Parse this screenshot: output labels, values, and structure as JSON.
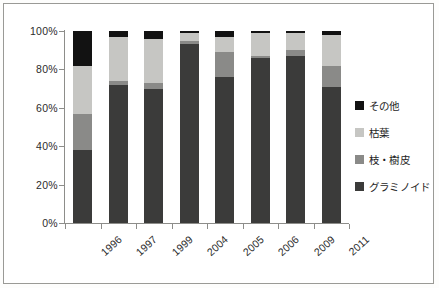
{
  "chart_data": {
    "type": "bar",
    "subtype": "stacked-percent",
    "title": "",
    "xlabel": "",
    "ylabel": "",
    "categories": [
      "1996",
      "1997",
      "1999",
      "2004",
      "2005",
      "2006",
      "2009",
      "2011"
    ],
    "ylim": [
      0,
      100
    ],
    "ytick_labels": [
      "0%",
      "20%",
      "40%",
      "60%",
      "80%",
      "100%"
    ],
    "ytick_values": [
      0,
      20,
      40,
      60,
      80,
      100
    ],
    "grid": false,
    "legend_position": "right",
    "stack_order_bottom_to_top": [
      "グラミノイド",
      "枝・樹皮",
      "枯葉",
      "その他"
    ],
    "series": [
      {
        "name": "グラミノイド",
        "color": "#3b3b3a",
        "values": [
          38,
          72,
          70,
          93,
          76,
          86,
          87,
          71
        ]
      },
      {
        "name": "枝・樹皮",
        "color": "#8a8a88",
        "values": [
          19,
          2,
          3,
          2,
          13,
          1,
          3,
          11
        ]
      },
      {
        "name": "枯葉",
        "color": "#c6c6c3",
        "values": [
          25,
          23,
          23,
          4,
          8,
          12,
          9,
          16
        ]
      },
      {
        "name": "その他",
        "color": "#121212",
        "values": [
          18,
          3,
          4,
          1,
          3,
          1,
          1,
          2
        ]
      }
    ]
  },
  "legend": {
    "items": [
      {
        "label": "その他",
        "color": "#121212"
      },
      {
        "label": "枯葉",
        "color": "#c6c6c3"
      },
      {
        "label": "枝・樹皮",
        "color": "#8a8a88"
      },
      {
        "label": "グラミノイド",
        "color": "#3b3b3a"
      }
    ]
  },
  "axes": {
    "y_labels": [
      "100%",
      "80%",
      "60%",
      "40%",
      "20%",
      "0%"
    ],
    "x_labels": [
      "1996",
      "1997",
      "1999",
      "2004",
      "2005",
      "2006",
      "2009",
      "2011"
    ]
  }
}
